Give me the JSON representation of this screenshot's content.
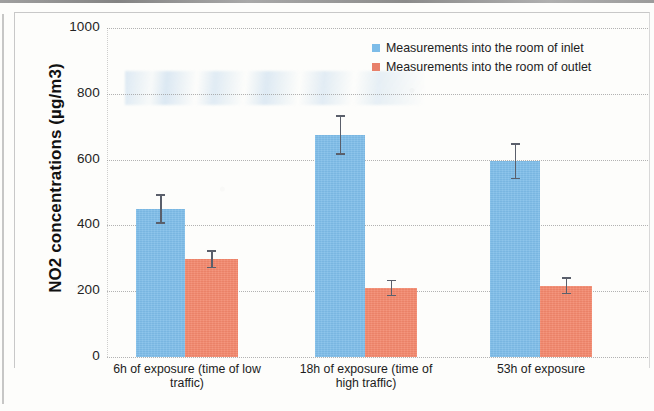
{
  "chart_data": {
    "type": "bar",
    "title": "",
    "xlabel": "",
    "ylabel": "NO2 concentrations (µg/m3)",
    "ylim": [
      0,
      1000
    ],
    "ytick_labels": [
      "1000",
      "800",
      "600",
      "400",
      "200",
      "0"
    ],
    "ytick_values": [
      1000,
      800,
      600,
      400,
      200,
      0
    ],
    "grid": "horizontal dotted gridlines at every 200 µg/m3",
    "legend_position": "top-right inside plot area",
    "categories": [
      "6h of exposure (time of low traffic)",
      "18h of exposure (time of high traffic)",
      "53h of exposure"
    ],
    "category_lines": [
      [
        "6h of exposure (time of low",
        "traffic)"
      ],
      [
        "18h of exposure (time of",
        "high traffic)"
      ],
      [
        "53h of exposure"
      ]
    ],
    "series": [
      {
        "name": "Measurements into the room of inlet",
        "color": "#7dbce8",
        "values": [
          450,
          675,
          595
        ],
        "err_low": [
          405,
          615,
          540
        ],
        "err_high": [
          495,
          735,
          650
        ]
      },
      {
        "name": "Measurements into the room of outlet",
        "color": "#f2866b",
        "values": [
          297,
          210,
          215
        ],
        "err_low": [
          270,
          185,
          190
        ],
        "err_high": [
          325,
          235,
          242
        ]
      }
    ]
  },
  "legend": {
    "items": [
      {
        "label": "Measurements into the room of inlet",
        "color": "#7dbce8"
      },
      {
        "label": "Measurements into the room of outlet",
        "color": "#e8806a"
      }
    ]
  }
}
